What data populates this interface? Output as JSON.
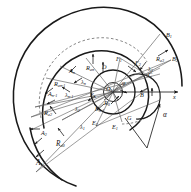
{
  "figure": {
    "type": "geometric-construction-diagram",
    "background_color": "#ffffff",
    "line_color": "#1a1a1a",
    "thin_line_color": "#555555",
    "dashed_line_color": "#777777"
  },
  "axes": {
    "x_axis_label": "x",
    "x_axis_arrow": "right"
  },
  "points": {
    "A1": "A",
    "A1_sub": "1",
    "A2": "A",
    "A2_sub": "2",
    "An_minus_1": "A",
    "An_minus_1_sub": "n-1",
    "An": "A",
    "An_sub": "n",
    "B": "B",
    "B1": "B",
    "B1_sub": "1",
    "B2": "B",
    "B2_sub": "2",
    "C": "C",
    "D": "D",
    "E1": "E",
    "E1_sub": "1",
    "E2": "E",
    "E2_sub": "2",
    "En_minus_1": "E",
    "En_minus_1_sub": "n-1",
    "En": "E",
    "En_sub": "n",
    "F1": "F",
    "F1_sub": "1",
    "F2": "F",
    "F2_sub": "2",
    "G": "G",
    "O1": "O",
    "O1_sub": "1"
  },
  "radii": {
    "Ra0": "R",
    "Ra0_sub": "a0",
    "Ra2": "R",
    "Ra2_sub": "a2",
    "Ra3": "R",
    "Ra3_sub": "a3",
    "Ran_minus_1": "R",
    "Ran_minus_1_sub": "an-1",
    "Ran": "R",
    "Ran_sub": "an",
    "R0": "R",
    "R0_sub": "0"
  },
  "angles": {
    "lambda1": "λ",
    "lambda1_sub": "1",
    "lambda2": "λ",
    "lambda2_sub": "2",
    "lambda3": "λ",
    "lambda3_sub": "3",
    "lambda_n_minus_1": "λ",
    "lambda_n_minus_1_sub": "n-1",
    "lambda_n": "λ",
    "lambda_n_sub": "n",
    "alpha": "α",
    "phi": "φ"
  }
}
